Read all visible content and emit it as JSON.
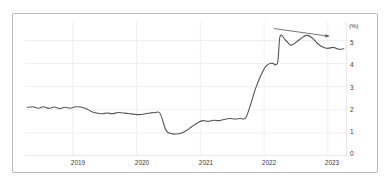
{
  "chart_data": {
    "type": "line",
    "title": "",
    "subtitle": "",
    "xlabel": "",
    "ylabel": "",
    "unit_label": "(%)",
    "ylim": [
      0,
      5.8
    ],
    "yticks": [
      0,
      1,
      2,
      3,
      4,
      5
    ],
    "ytick_labels": [
      "0",
      "1",
      "2",
      "3",
      "4",
      "5"
    ],
    "xlim": [
      2018.25,
      2023.3
    ],
    "xticks": [
      2019,
      2020,
      2021,
      2022,
      2023
    ],
    "xtick_labels": [
      "2019",
      "2020",
      "2021",
      "2022",
      "2023"
    ],
    "grid": true,
    "grid_horizontal": true,
    "grid_vertical": true,
    "legend": false,
    "legend_position": "none",
    "line_color": "#555555",
    "grid_color": "#e8e8e8",
    "axis_color": "#c9c9c9",
    "annotations": [
      {
        "name": "downtrend-arrow",
        "type": "arrow",
        "x_start": 2022.15,
        "y_start": 5.52,
        "x_end": 2023.02,
        "y_end": 5.18,
        "label": ""
      }
    ],
    "series": [
      {
        "name": "rate",
        "x": [
          2018.29,
          2018.37,
          2018.46,
          2018.54,
          2018.62,
          2018.71,
          2018.79,
          2018.87,
          2018.96,
          2019.04,
          2019.12,
          2019.21,
          2019.29,
          2019.37,
          2019.46,
          2019.54,
          2019.62,
          2019.71,
          2019.79,
          2019.87,
          2019.96,
          2020.04,
          2020.12,
          2020.21,
          2020.29,
          2020.37,
          2020.46,
          2020.54,
          2020.62,
          2020.71,
          2020.79,
          2020.87,
          2020.96,
          2021.04,
          2021.12,
          2021.21,
          2021.29,
          2021.37,
          2021.46,
          2021.54,
          2021.62,
          2021.71,
          2021.79,
          2021.87,
          2021.96,
          2022.04,
          2022.12,
          2022.21,
          2022.29,
          2022.37,
          2022.46,
          2022.54,
          2022.62,
          2022.71,
          2022.79,
          2022.87,
          2022.96,
          2023.04,
          2023.12,
          2023.2
        ],
        "y": [
          2.1,
          2.13,
          2.07,
          2.13,
          2.06,
          2.12,
          2.05,
          2.11,
          2.07,
          2.13,
          2.12,
          2.05,
          1.93,
          1.86,
          1.83,
          1.86,
          1.83,
          1.88,
          1.86,
          1.84,
          1.81,
          1.79,
          1.82,
          1.86,
          1.88,
          1.84,
          1.12,
          0.97,
          0.95,
          1.0,
          1.12,
          1.28,
          1.44,
          1.53,
          1.5,
          1.55,
          1.53,
          1.58,
          1.62,
          1.6,
          1.62,
          1.65,
          2.25,
          2.95,
          3.55,
          3.92,
          4.02,
          4.03,
          4.02,
          4.05,
          4.3,
          4.7,
          5.05,
          5.28,
          5.4,
          5.44,
          5.3,
          5.08,
          4.95,
          4.98
        ],
        "y_extra": [
          5.18,
          5.02,
          4.8,
          4.92,
          5.1,
          5.22,
          5.12,
          4.88,
          4.72,
          4.66,
          4.7,
          4.62,
          4.64
        ],
        "color": "#555555",
        "width": 1.1
      }
    ]
  }
}
